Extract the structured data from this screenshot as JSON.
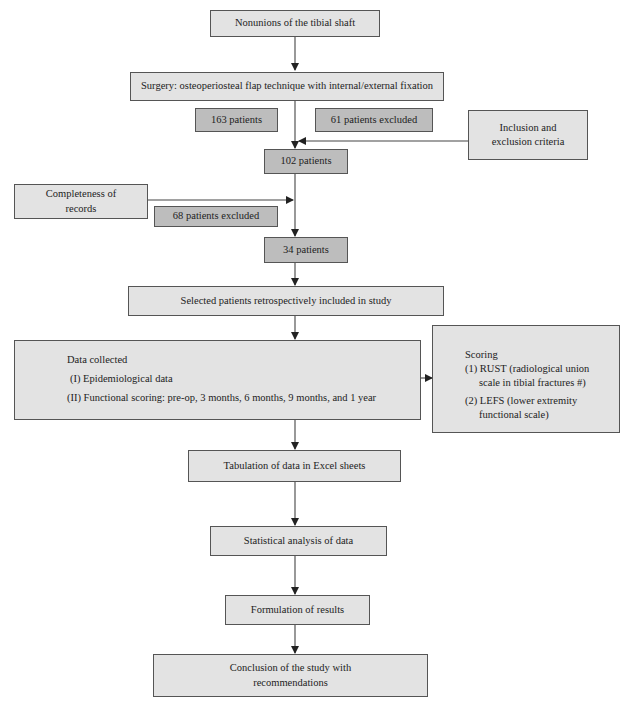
{
  "flowchart": {
    "nodes": {
      "nonunions": "Nonunions of the tibial shaft",
      "surgery": "Surgery: osteoperiosteal flap technique with internal/external fixation",
      "patients_163": "163 patients",
      "excluded_61": "61 patients excluded",
      "inclusion_criteria": "Inclusion and exclusion criteria",
      "patients_102": "102 patients",
      "completeness": "Completeness of records",
      "excluded_68": "68 patients excluded",
      "patients_34": "34 patients",
      "selected": "Selected patients retrospectively included in study",
      "data_collected": {
        "title": "Data collected",
        "items": [
          "(I) Epidemiological data",
          "(II) Functional scoring: pre-op, 3 months, 6 months, 9 months, and 1 year"
        ]
      },
      "scoring": {
        "title": "Scoring",
        "items": [
          {
            "label": "(1) RUST (radiological union",
            "cont": "scale in tibial fractures #)"
          },
          {
            "label": "(2) LEFS (lower extremity",
            "cont": "functional scale)"
          }
        ]
      },
      "tabulation": "Tabulation of data in Excel sheets",
      "statistical": "Statistical analysis of data",
      "formulation": "Formulation of results",
      "conclusion": "Conclusion of the study with recommendations"
    },
    "colors": {
      "light_box": "#e3e3e3",
      "dark_box": "#bdbdbd",
      "border": "#555555",
      "arrow": "#333333"
    }
  }
}
